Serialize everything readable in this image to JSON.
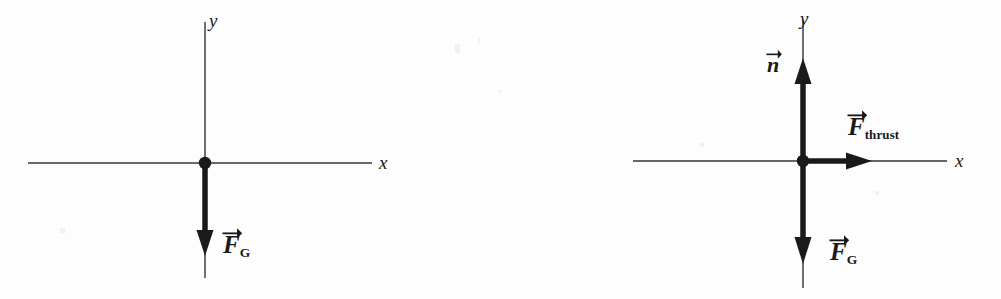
{
  "figure": {
    "type": "free-body-diagram-pair",
    "background_color": "#fdfdfd",
    "ink_color": "#1a1a1a"
  },
  "diagrams": [
    {
      "name": "left",
      "axes": {
        "x_label": "x",
        "y_label": "y"
      },
      "origin_label": "particle-dot",
      "vectors": [
        {
          "name": "weight",
          "symbol": "F",
          "subscript": "G",
          "direction": "down",
          "has_vector_arrow": true
        }
      ]
    },
    {
      "name": "right",
      "axes": {
        "x_label": "x",
        "y_label": "y"
      },
      "origin_label": "particle-dot",
      "vectors": [
        {
          "name": "normal",
          "symbol": "n",
          "subscript": "",
          "direction": "up",
          "has_vector_arrow": true
        },
        {
          "name": "thrust",
          "symbol": "F",
          "subscript": "thrust",
          "direction": "right",
          "has_vector_arrow": true
        },
        {
          "name": "weight",
          "symbol": "F",
          "subscript": "G",
          "direction": "down",
          "has_vector_arrow": true
        }
      ]
    }
  ]
}
